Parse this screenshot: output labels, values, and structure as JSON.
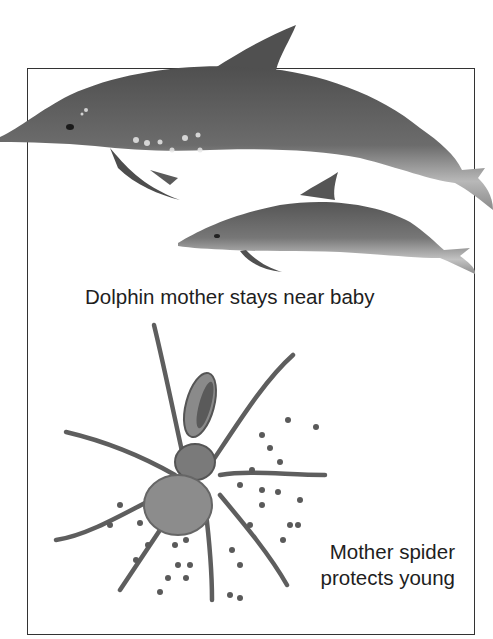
{
  "figure": {
    "panels": [
      {
        "id": "dolphin",
        "illustration": "dolphin-mother-and-calf",
        "caption": "Dolphin mother stays near baby"
      },
      {
        "id": "spider",
        "illustration": "wolf-spider-with-spiderlings",
        "caption_lines": [
          "Mother spider",
          "protects young"
        ]
      }
    ],
    "colors": {
      "frame": "#333333",
      "text": "#1e1e1e",
      "dolphin_dark": "#5a5a5a",
      "dolphin_light": "#b5b5b5",
      "spider": "#6a6a6a"
    }
  }
}
